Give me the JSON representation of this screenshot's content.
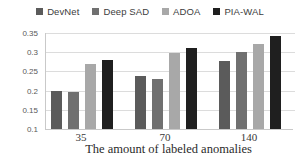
{
  "chart_data": {
    "type": "bar",
    "title": "",
    "xlabel": "The amount of labeled anomalies",
    "ylabel": "",
    "categories": [
      "35",
      "70",
      "140"
    ],
    "series": [
      {
        "name": "DevNet",
        "color": "#5b5b5b",
        "values": [
          0.2,
          0.237,
          0.278
        ]
      },
      {
        "name": "Deep SAD",
        "color": "#707070",
        "values": [
          0.197,
          0.229,
          0.301
        ]
      },
      {
        "name": "ADOA",
        "color": "#a8a8a8",
        "values": [
          0.269,
          0.299,
          0.322
        ]
      },
      {
        "name": "PIA-WAL",
        "color": "#1f1f1f",
        "values": [
          0.279,
          0.311,
          0.342
        ]
      }
    ],
    "ylim": [
      0.1,
      0.35
    ],
    "yticks": [
      0.1,
      0.15,
      0.2,
      0.25,
      0.3,
      0.35
    ],
    "ytick_labels": [
      "0.1",
      "0.15",
      "0.2",
      "0.25",
      "0.3",
      "0.35"
    ],
    "grid": true,
    "legend_position": "top"
  },
  "colors": {
    "background": "#ffffff",
    "gridline": "#dcdcdc",
    "axis_line": "#c9c9c9",
    "tick_text": "#595959",
    "category_text": "#383838",
    "legend_text": "#3d3d3d"
  }
}
